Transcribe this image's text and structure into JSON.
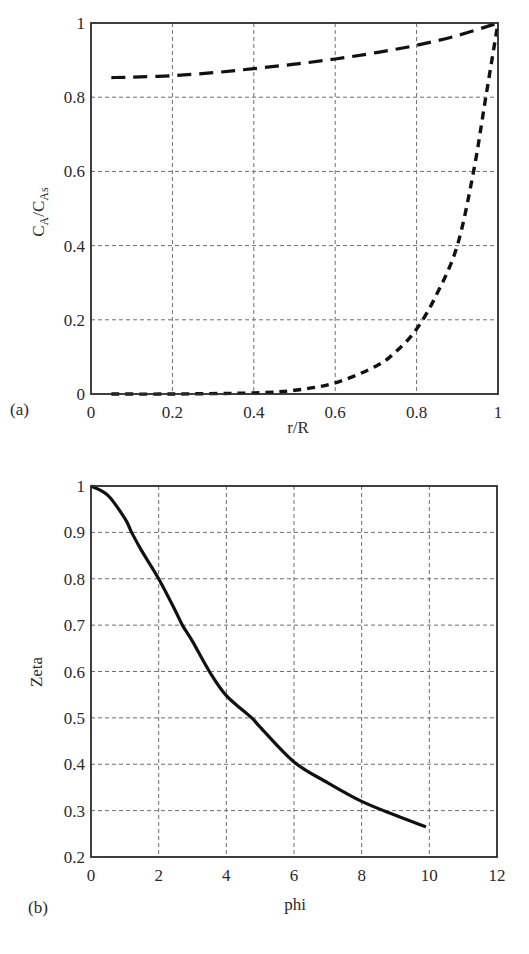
{
  "chart_data": [
    {
      "panel": "(a)",
      "type": "line",
      "xlabel": "r/R",
      "ylabel": "C_A/C_As",
      "ylabel_main": "C",
      "ylabel_sub1": "A",
      "ylabel_sub2": "As",
      "xlim": [
        0,
        1
      ],
      "ylim": [
        0,
        1
      ],
      "xticks": [
        0,
        0.2,
        0.4,
        0.6,
        0.8,
        1
      ],
      "xtick_labels": [
        "0",
        "0.2",
        "0.4",
        "0.6",
        "0.8",
        "1"
      ],
      "yticks": [
        0,
        0.2,
        0.4,
        0.6,
        0.8,
        1
      ],
      "ytick_labels": [
        "0",
        "0.2",
        "0.4",
        "0.6",
        "0.8",
        "1"
      ],
      "grid": true,
      "legend": null,
      "plot_box": {
        "left": 91,
        "top": 23,
        "right": 498,
        "bottom": 394
      },
      "series": [
        {
          "name": "upper (long dashes)",
          "style": "long-dash",
          "x": [
            0.05,
            0.1,
            0.2,
            0.3,
            0.4,
            0.5,
            0.6,
            0.7,
            0.8,
            0.9,
            1.0
          ],
          "y": [
            0.853,
            0.854,
            0.858,
            0.866,
            0.877,
            0.889,
            0.903,
            0.92,
            0.94,
            0.966,
            1.0
          ]
        },
        {
          "name": "lower (short dashes)",
          "style": "short-dash",
          "x": [
            0.05,
            0.2,
            0.4,
            0.5,
            0.6,
            0.7,
            0.75,
            0.8,
            0.85,
            0.9,
            0.94,
            0.97,
            1.0
          ],
          "y": [
            0.0,
            0.0,
            0.003,
            0.01,
            0.03,
            0.075,
            0.115,
            0.175,
            0.27,
            0.4,
            0.6,
            0.8,
            1.0
          ]
        }
      ]
    },
    {
      "panel": "(b)",
      "type": "line",
      "xlabel": "phi",
      "ylabel": "Zeta",
      "xlim": [
        0,
        12
      ],
      "ylim": [
        0.2,
        1
      ],
      "xticks": [
        0,
        2,
        4,
        6,
        8,
        10,
        12
      ],
      "xtick_labels": [
        "0",
        "2",
        "4",
        "6",
        "8",
        "10",
        "12"
      ],
      "yticks": [
        0.2,
        0.3,
        0.4,
        0.5,
        0.6,
        0.7,
        0.8,
        0.9,
        1
      ],
      "ytick_labels": [
        "0.2",
        "0.3",
        "0.4",
        "0.5",
        "0.6",
        "0.7",
        "0.8",
        "0.9",
        "1"
      ],
      "grid": true,
      "legend": null,
      "plot_box": {
        "left": 91,
        "top": 486,
        "right": 497,
        "bottom": 857
      },
      "series": [
        {
          "name": "Zeta vs phi",
          "style": "solid",
          "x": [
            0,
            0.5,
            1.0,
            1.2,
            1.5,
            2.0,
            2.5,
            2.7,
            3.0,
            3.5,
            4.0,
            4.75,
            5.0,
            6.0,
            7.0,
            8.0,
            9.0,
            9.9
          ],
          "y": [
            1.0,
            0.98,
            0.93,
            0.9,
            0.86,
            0.8,
            0.73,
            0.7,
            0.665,
            0.6,
            0.548,
            0.5,
            0.48,
            0.405,
            0.36,
            0.32,
            0.29,
            0.265
          ]
        }
      ]
    }
  ],
  "panels": {
    "a": {
      "label": "(a)",
      "xlabel": "r/R"
    },
    "b": {
      "label": "(b)",
      "xlabel": "phi",
      "ylabel": "Zeta"
    }
  },
  "colors": {
    "axis": "#2b2b2b",
    "grid": "#6e6e6e",
    "curve": "#111111",
    "text": "#2a2a2a",
    "background": "#ffffff"
  }
}
